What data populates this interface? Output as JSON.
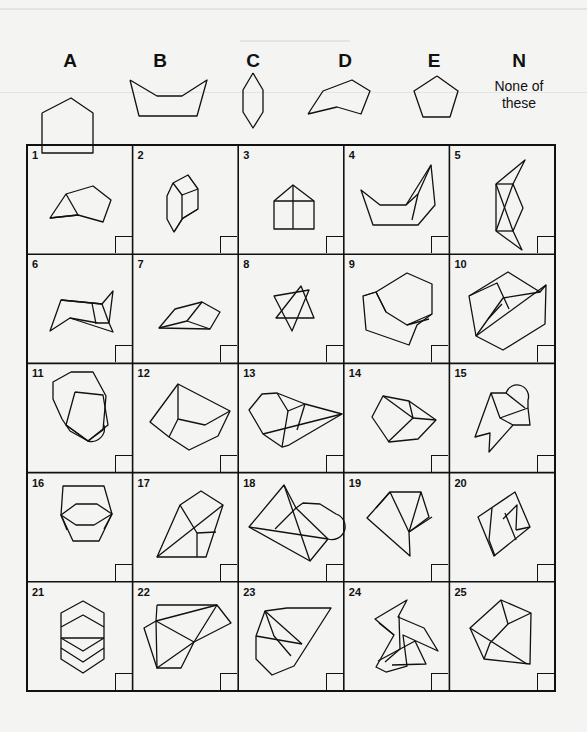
{
  "reference_shapes": [
    {
      "id": "A",
      "label": "A",
      "x": 70,
      "points": "42,113 71,98 93,113 93,113 93,153 42,153 42,113"
    },
    {
      "id": "B",
      "label": "B",
      "x": 160,
      "points": "130,80 157,96 182,96 207,80 197,116 139,116 130,80"
    },
    {
      "id": "C",
      "label": "C",
      "x": 253,
      "points": "253,73 263,90 263,112 253,128 243,112 243,90 253,73"
    },
    {
      "id": "D",
      "label": "D",
      "x": 345,
      "points": "308,114 323,91 352,80 370,91 361,114 337,107 308,114"
    },
    {
      "id": "E",
      "label": "E",
      "x": 434,
      "points": "437,76 458,91 450,117 423,117 414,91 437,76"
    },
    {
      "id": "N",
      "label": "N",
      "x": 519,
      "sub": "None of these"
    }
  ],
  "grid": {
    "left": 27,
    "top": 145,
    "col_w": 105.6,
    "row_h": 109.2,
    "cols": 5,
    "rows": 5,
    "cells": [
      {
        "n": "1"
      },
      {
        "n": "2"
      },
      {
        "n": "3"
      },
      {
        "n": "4"
      },
      {
        "n": "5"
      },
      {
        "n": "6"
      },
      {
        "n": "7"
      },
      {
        "n": "8"
      },
      {
        "n": "9"
      },
      {
        "n": "10"
      },
      {
        "n": "11"
      },
      {
        "n": "12"
      },
      {
        "n": "13"
      },
      {
        "n": "14"
      },
      {
        "n": "15"
      },
      {
        "n": "16"
      },
      {
        "n": "17"
      },
      {
        "n": "18"
      },
      {
        "n": "19"
      },
      {
        "n": "20"
      },
      {
        "n": "21"
      },
      {
        "n": "22"
      },
      {
        "n": "23"
      },
      {
        "n": "24"
      },
      {
        "n": "25"
      }
    ]
  },
  "figures": [
    [
      "M50,218 L66,194 L93,186 L111,200 L103,222 L78,215 Z",
      "M66,194 L78,215 L50,218"
    ],
    [
      "M173,183 L188,175 L198,189 L198,209 L183,218 L174,232 L167,219 L167,196 Z",
      "M173,183 L182,195 L198,189",
      "M182,195 L182,219 L198,209",
      "M182,219 L174,232"
    ],
    [
      "M274,201 L293,185 L314,201 L314,229 L274,229 Z",
      "M274,201 L314,201",
      "M293,185 L293,229"
    ],
    [
      "M361,190 L380,205 L406,205 L431,165 L435,205 L418,225 L373,225 Z",
      "M406,205 L418,194 L431,165",
      "M418,194 L412,220"
    ],
    [
      "M496,184 L525,160 L513,184 L523,208 L513,231 L522,250 L496,231 Z",
      "M496,184 L513,184",
      "M496,231 L513,231",
      "M496,184 L513,231",
      "M513,184 L496,231"
    ],
    [
      "M50,331 L61,300 L102,304 L113,291 L109,323 L113,332 L70,318 Z",
      "M61,300 L92,303 L102,304",
      "M70,318 L98,323 L109,323",
      "M102,304 L109,323",
      "M92,303 L96,324"
    ],
    [
      "M159,328 L175,309 L202,302 L220,312 L210,329 Z",
      "M202,302 L187,321 L159,328",
      "M187,321 L210,329"
    ],
    [
      "M274,296 L309,290 L292,331 Z",
      "M276,318 L314,318 L301,286 Z"
    ],
    [
      "M376,292 L407,273 L432,284 L432,314 L417,325 L409,345 L366,330 L363,296 Z",
      "M363,296 L376,292 L386,312 L407,325 L432,314",
      "M386,312 L376,292",
      "M407,325 L429,319"
    ],
    [
      "M469,296 L508,272 L540,292 L546,285 L545,324 L503,350 L476,336 Z",
      "M469,296 L497,283 L509,309",
      "M476,336 L546,285",
      "M476,336 L503,298 L540,292",
      "M488,319 L502,304"
    ],
    [
      "M53,382 L71,372 L93,372 L106,396 L103,430 L88,441 L70,431 L62,419 L53,399 Z",
      "M75,392 L103,395 L108,425 L88,441 L66,425 L75,392",
      "M66,425 L88,441",
      "M104,425 A13,13 0 0,1 88,441"
    ],
    [
      "M150,422 L178,384 L230,411 L218,436 L189,450 L169,437 Z",
      "M178,384 L178,419 L205,425 L230,411",
      "M178,419 L169,437"
    ],
    [
      "M249,410 L262,394 L277,393 L305,404 L342,414 L289,445 L282,447 L263,434 Z",
      "M277,393 L288,411 L305,404",
      "M288,411 L282,447",
      "M263,434 L342,414",
      "M305,404 L297,430"
    ],
    [
      "M372,417 L383,396 L409,401 L436,420 L418,439 L389,442 Z",
      "M383,396 L413,418 L409,401",
      "M413,418 L436,420",
      "M413,418 L388,442"
    ],
    [
      "M491,393 L506,393 A11,11 0 0,1 528,400 L528,408 L530,425 L513,425 L489,452 L490,433 L475,437 Z",
      "M491,393 L500,418 L513,425",
      "M506,393 L525,408",
      "M500,418 L528,408"
    ],
    [
      "M63,486 L104,486 L112,514 L99,541 L73,541 L61,515 Z",
      "M61,515 L76,504 L97,504 L112,514 L94,525 L76,525 Z",
      "M61,515 L67,530",
      "M112,514 L104,529"
    ],
    [
      "M157,557 L180,505 L201,491 L223,505 L206,557 Z",
      "M157,557 L223,505",
      "M180,505 L197,533 L197,557",
      "M197,533 L216,532"
    ],
    [
      "M249,527 L284,485 L296,508 L303,503 L320,504 L336,514 A13,13 0 0,1 328,539 L310,561 Z",
      "M249,527 L328,539",
      "M284,485 L310,561",
      "M275,529 L296,508",
      "M296,508 L328,539"
    ],
    [
      "M367,518 L390,492 L421,492 L429,517 L409,532 L410,556 Z",
      "M376,508 L390,492",
      "M390,492 L409,532",
      "M421,492 L409,532",
      "M409,532 L432,517"
    ],
    [
      "M478,517 L515,492 L530,527 L494,556 Z",
      "M492,508 L489,540 L495,556",
      "M505,513 L516,540",
      "M503,519 L517,505 L516,530",
      "M516,530 L530,527"
    ],
    [
      "M61,613 L83,601 L104,613 L104,659 L83,673 L61,659 Z",
      "M61,627 L83,615 L104,627",
      "M61,638 L83,651 L104,638",
      "M61,648 L83,662 L104,648",
      "M61,638 L104,638"
    ],
    [
      "M144,628 L156,621 L217,605 L231,623 L194,642 L181,668 L157,668 Z",
      "M156,621 L157,668 L194,642",
      "M156,621 L194,642 L217,605",
      "M157,605 L156,621",
      "M157,605 L217,605"
    ],
    [
      "M265,611 L287,608 L331,608 L294,666 L272,675 L256,659 L256,636 Z",
      "M265,611 L302,644",
      "M256,636 L302,644",
      "M265,611 L274,636 L291,656"
    ],
    [
      "M375,619 L407,600 L398,617 L424,628 L438,651 L403,635 L407,666 L386,672 L376,667 L394,635 Z",
      "M379,623 L394,635",
      "M399,616 L400,649 L385,662",
      "M378,661 L415,641 L426,664 L392,665"
    ],
    [
      "M470,628 L501,600 L531,613 L530,664 L484,659 Z",
      "M470,628 L527,664",
      "M501,600 L508,624 L531,613",
      "M508,624 L490,643 L484,659"
    ]
  ]
}
